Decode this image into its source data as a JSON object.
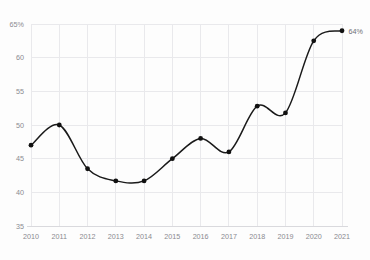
{
  "chart_data": {
    "type": "line",
    "title": "",
    "subtitle": "",
    "xlabel": "",
    "ylabel": "",
    "categories": [
      "2010",
      "2011",
      "2012",
      "2013",
      "2014",
      "2015",
      "2016",
      "2017",
      "2018",
      "2019",
      "2020",
      "2021"
    ],
    "values": [
      47,
      50,
      43.5,
      41.7,
      41.7,
      45,
      48,
      46,
      52.8,
      51.8,
      62.5,
      64
    ],
    "series": [
      {
        "name": "",
        "values": [
          47,
          50,
          43.5,
          41.7,
          41.7,
          45,
          48,
          46,
          52.8,
          51.8,
          62.5,
          64
        ]
      }
    ],
    "ylim": [
      35,
      65
    ],
    "xlim": [
      "2010",
      "2021"
    ],
    "y_ticks": [
      35,
      40,
      45,
      50,
      55,
      60,
      65
    ],
    "y_tick_labels": [
      "35",
      "40",
      "45",
      "50",
      "55",
      "60",
      "65%"
    ],
    "x_ticks": [
      "2010",
      "2011",
      "2012",
      "2013",
      "2014",
      "2015",
      "2016",
      "2017",
      "2018",
      "2019",
      "2020",
      "2021"
    ],
    "grid": true,
    "grid_axis": "both",
    "legend": false,
    "legend_position": "none",
    "line_color": "#1a1a1a",
    "marker_color": "#111111",
    "marker_shape": "circle",
    "grid_color": "#e9e9ec",
    "background_color": "#fdfdfd",
    "tick_label_color": "#8a8a90",
    "smoothing": "spline",
    "annotations": [
      {
        "text": "64%",
        "target_category": "2021",
        "target_value": 64,
        "color": "#6e6e74"
      }
    ]
  }
}
